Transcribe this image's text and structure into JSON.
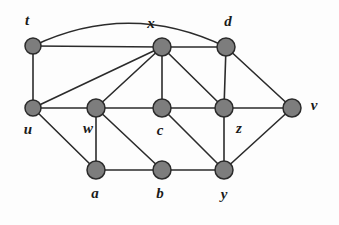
{
  "figure": {
    "background_color": "#fdfdfd",
    "node_fill_color": "#7d7d7d",
    "node_stroke_color": "#2b2b2b",
    "edge_color": "#2b2b2b",
    "label_color": "#1a1a1a"
  },
  "chart_data": {
    "type": "diagram",
    "title": "",
    "node_count": 11,
    "edge_count": 22,
    "nodes": [
      {
        "id": "t",
        "label": "t",
        "x": 33,
        "y": 46,
        "r": 8,
        "label_x": 27,
        "label_y": 22
      },
      {
        "id": "x",
        "label": "x",
        "x": 162,
        "y": 47,
        "r": 9,
        "label_x": 151,
        "label_y": 25
      },
      {
        "id": "d",
        "label": "d",
        "x": 226,
        "y": 47,
        "r": 9,
        "label_x": 228,
        "label_y": 23
      },
      {
        "id": "u",
        "label": "u",
        "x": 33,
        "y": 108,
        "r": 8,
        "label_x": 28,
        "label_y": 131
      },
      {
        "id": "w",
        "label": "w",
        "x": 96,
        "y": 108,
        "r": 9,
        "label_x": 88,
        "label_y": 130
      },
      {
        "id": "c",
        "label": "c",
        "x": 162,
        "y": 108,
        "r": 9,
        "label_x": 160,
        "label_y": 132
      },
      {
        "id": "z",
        "label": "z",
        "x": 224,
        "y": 108,
        "r": 9,
        "label_x": 239,
        "label_y": 130
      },
      {
        "id": "v",
        "label": "v",
        "x": 292,
        "y": 108,
        "r": 9,
        "label_x": 314,
        "label_y": 107
      },
      {
        "id": "a",
        "label": "a",
        "x": 96,
        "y": 170,
        "r": 9,
        "label_x": 95,
        "label_y": 195
      },
      {
        "id": "b",
        "label": "b",
        "x": 162,
        "y": 170,
        "r": 9,
        "label_x": 160,
        "label_y": 195
      },
      {
        "id": "y",
        "label": "y",
        "x": 224,
        "y": 170,
        "r": 9,
        "label_x": 224,
        "label_y": 196
      }
    ],
    "edges": [
      {
        "from": "t",
        "to": "x",
        "curved": false
      },
      {
        "from": "x",
        "to": "d",
        "curved": false
      },
      {
        "from": "t",
        "to": "d",
        "curved": true,
        "arc_peak_y": 12
      },
      {
        "from": "t",
        "to": "u",
        "curved": false
      },
      {
        "from": "u",
        "to": "x",
        "curved": false
      },
      {
        "from": "w",
        "to": "x",
        "curved": false
      },
      {
        "from": "x",
        "to": "c",
        "curved": false
      },
      {
        "from": "x",
        "to": "z",
        "curved": false
      },
      {
        "from": "d",
        "to": "z",
        "curved": false
      },
      {
        "from": "d",
        "to": "v",
        "curved": false
      },
      {
        "from": "u",
        "to": "w",
        "curved": false
      },
      {
        "from": "w",
        "to": "c",
        "curved": false
      },
      {
        "from": "c",
        "to": "z",
        "curved": false
      },
      {
        "from": "z",
        "to": "v",
        "curved": false
      },
      {
        "from": "u",
        "to": "a",
        "curved": false
      },
      {
        "from": "w",
        "to": "a",
        "curved": false
      },
      {
        "from": "w",
        "to": "b",
        "curved": false
      },
      {
        "from": "a",
        "to": "b",
        "curved": false
      },
      {
        "from": "b",
        "to": "y",
        "curved": false
      },
      {
        "from": "c",
        "to": "y",
        "curved": false
      },
      {
        "from": "z",
        "to": "y",
        "curved": false
      },
      {
        "from": "y",
        "to": "v",
        "curved": false
      }
    ]
  }
}
